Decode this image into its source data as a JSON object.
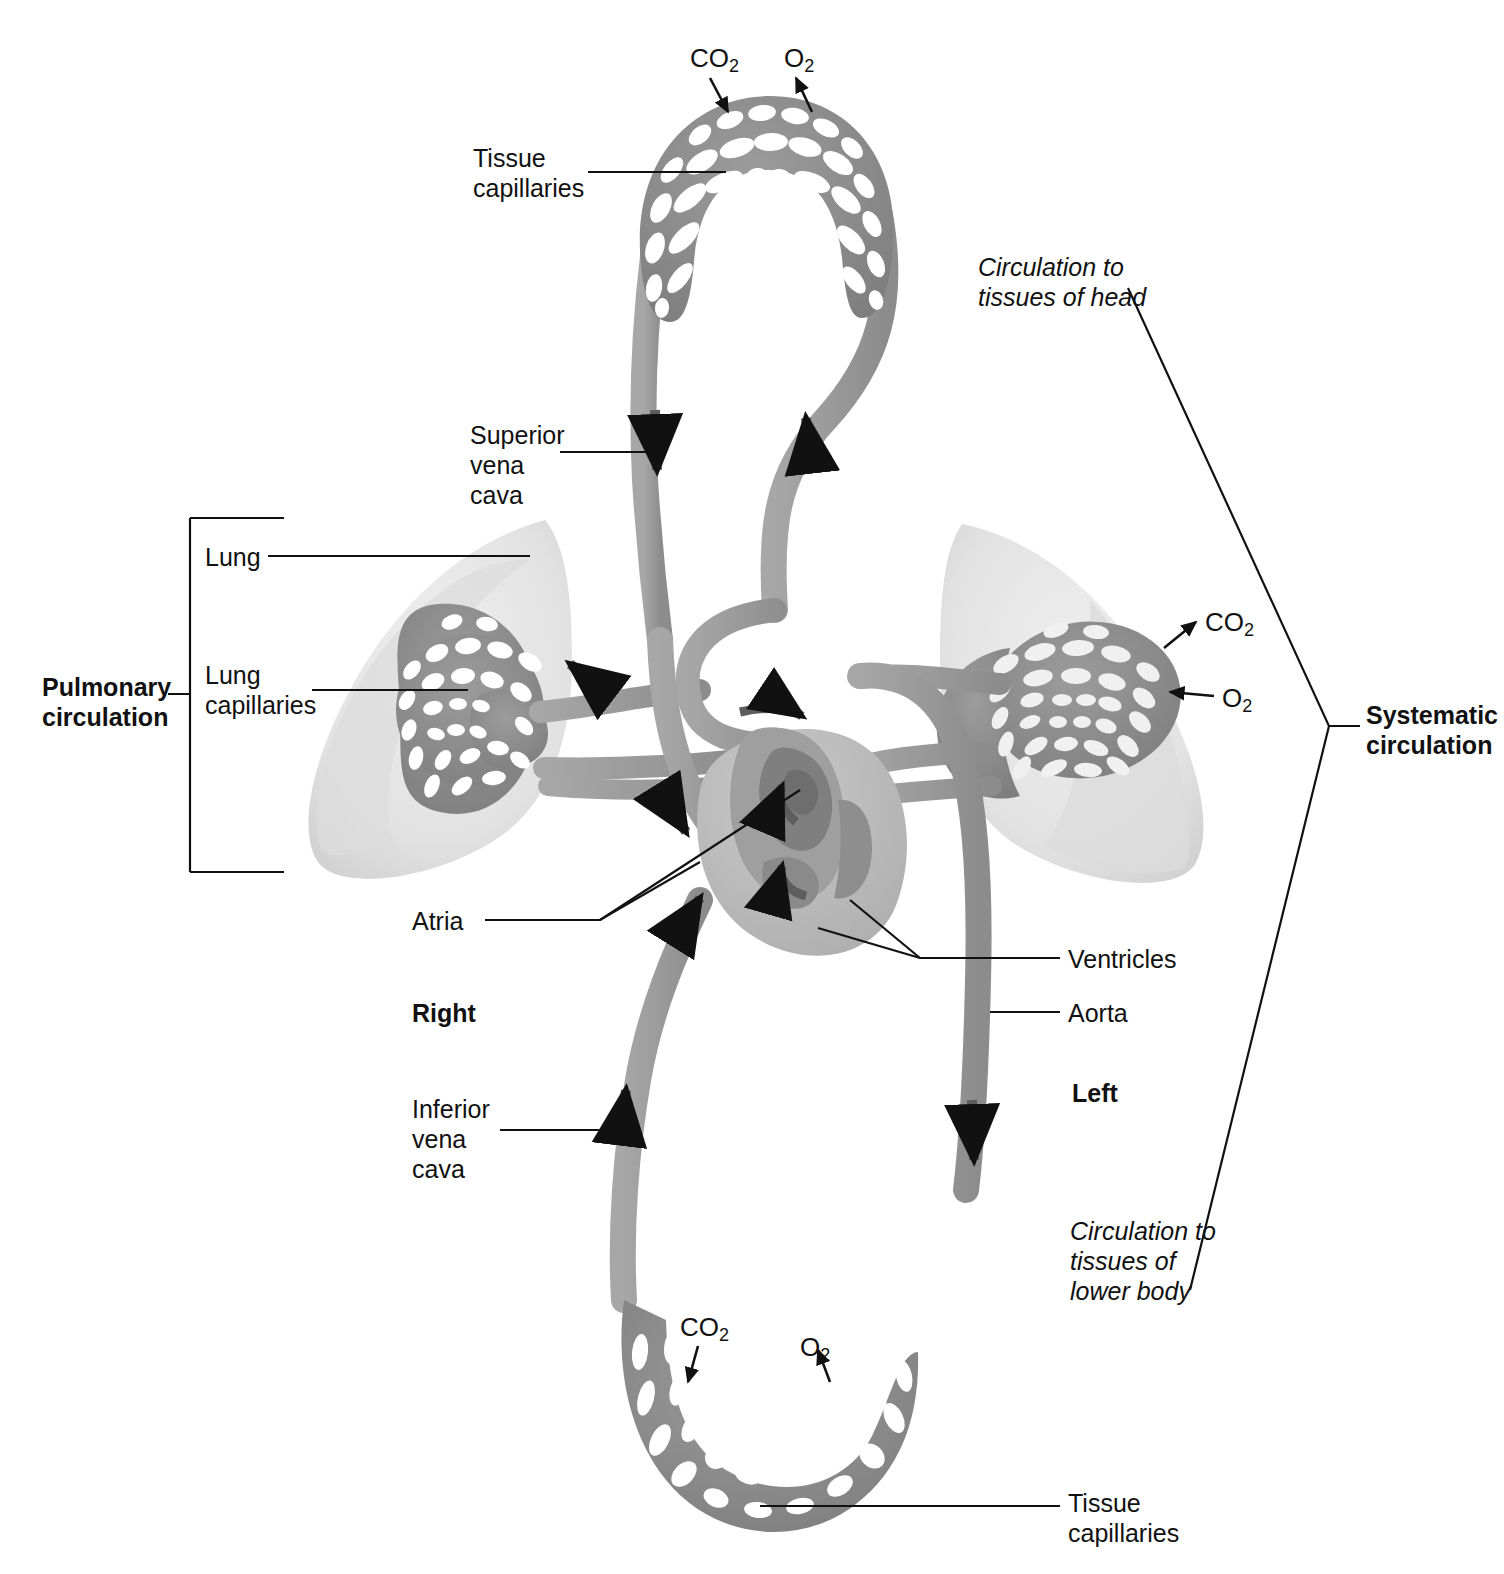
{
  "figure": {
    "colors": {
      "vessel": "#9a9a9a",
      "vessel_dark": "#6f6f6f",
      "arrow": "#5d5d5d",
      "lung": "#e7e7e7",
      "lung_shade": "#d6d6d6",
      "capillary_bed": "#8f8f8f",
      "pore": "#ffffff",
      "heart_light": "#c2c2c2",
      "heart_mid": "#a5a5a5",
      "heart_dark": "#7d7d7d",
      "leader_line": "#111111",
      "background": "#ffffff"
    }
  },
  "labels": {
    "tissue_capillaries_top": "Tissue\ncapillaries",
    "tissue_capillaries_bottom": "Tissue\ncapillaries",
    "superior_vena_cava": "Superior\nvena\ncava",
    "inferior_vena_cava": "Inferior\nvena\ncava",
    "lung": "Lung",
    "lung_capillaries": "Lung\ncapillaries",
    "atria": "Atria",
    "ventricles": "Ventricles",
    "aorta": "Aorta",
    "right": "Right",
    "left": "Left",
    "pulmonary_circulation": "Pulmonary\ncirculation",
    "systematic_circulation": "Systematic\ncirculation",
    "circulation_head": "Circulation to\ntissues of head",
    "circulation_lower_body": "Circulation to\ntissues of\nlower body"
  },
  "gases": {
    "co2": "CO",
    "co2_sub": "2",
    "o2": "O",
    "o2_sub": "2",
    "instances": [
      {
        "name": "co2-top",
        "label": "CO2",
        "x": 690,
        "y": 44
      },
      {
        "name": "o2-top",
        "label": "O2",
        "x": 784,
        "y": 44
      },
      {
        "name": "co2-right-lung",
        "label": "CO2",
        "x": 1205,
        "y": 608
      },
      {
        "name": "o2-right-lung",
        "label": "O2",
        "x": 1222,
        "y": 684
      },
      {
        "name": "co2-bottom",
        "label": "CO2",
        "x": 680,
        "y": 1313
      },
      {
        "name": "o2-bottom",
        "label": "O2",
        "x": 800,
        "y": 1333
      }
    ]
  }
}
